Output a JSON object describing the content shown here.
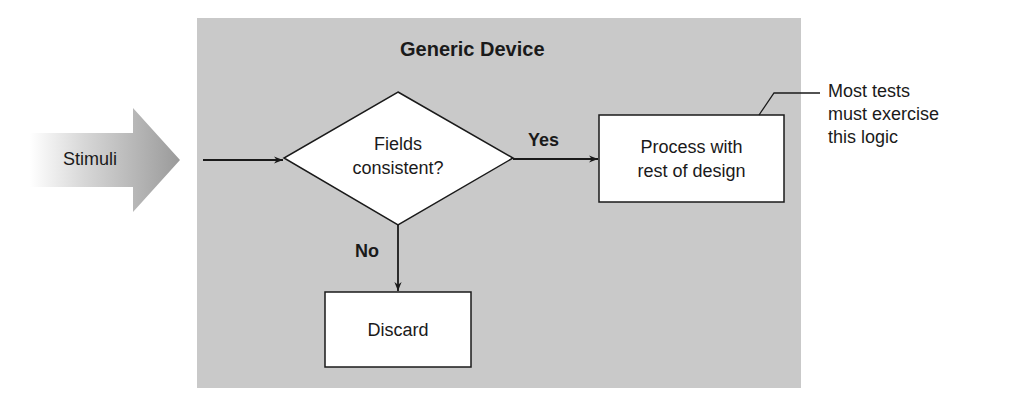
{
  "diagram": {
    "type": "flowchart",
    "container": {
      "title": "Generic Device",
      "fill": "#c9c9c9"
    },
    "input": {
      "label": "Stimuli"
    },
    "decision": {
      "line1": "Fields",
      "line2": "consistent?"
    },
    "edges": {
      "yes_label": "Yes",
      "no_label": "No"
    },
    "process": {
      "line1": "Process with",
      "line2": "rest of design"
    },
    "discard": {
      "label": "Discard"
    },
    "annotation": {
      "line1": "Most tests",
      "line2": "must exercise",
      "line3": "this logic"
    },
    "colors": {
      "panel": "#c9c9c9",
      "box_fill": "#ffffff",
      "stroke": "#1a1a1a",
      "arrow_gradient_start": "#ffffff",
      "arrow_gradient_end": "#9a9a9a"
    }
  }
}
